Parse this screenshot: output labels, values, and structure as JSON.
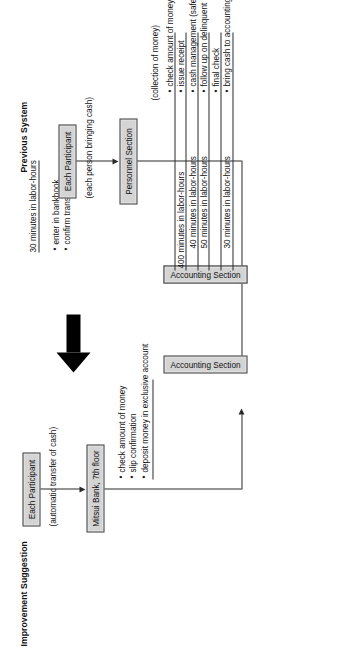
{
  "diagram": {
    "type": "business-process-flow",
    "orientation": "rotated-90-ccw",
    "sections": [
      {
        "id": "improvement",
        "title": "Improvement Suggestion",
        "nodes": [
          {
            "id": "participant",
            "label": "Each Participant"
          },
          {
            "id": "bank",
            "label": "Mitsui Bank, 7th floor"
          },
          {
            "id": "accounting",
            "label": "Accounting Section"
          },
          {
            "id": "personnel",
            "label": "Personnel Section"
          }
        ],
        "flow_caption": "(automatic transfer of cash)",
        "accounting_tasks": [
          "check amount of money",
          "slip confirmation",
          "deposit money in exclusive account"
        ],
        "personnel_metric": "30 minutes in labor-hours",
        "personnel_tasks": [
          "enter in bankbook",
          "confirm transfer"
        ]
      },
      {
        "id": "previous",
        "title": "Previous System",
        "nodes": [
          {
            "id": "participant",
            "label": "Each Participant"
          },
          {
            "id": "personnel",
            "label": "Personnel Section"
          },
          {
            "id": "accounting",
            "label": "Accounting Section"
          }
        ],
        "flow_caption": "(each person bringing cash)",
        "group_caption": "(collection of money)",
        "tasks": [
          {
            "label": "check amount of money",
            "metric": ""
          },
          {
            "label": "issue receipt",
            "metric": "400 minutes in labor-hours"
          },
          {
            "label": "cash management (safe-deposit box)",
            "metric": "40 minutes in labor-hours"
          },
          {
            "label": "follow up on delinquent payers",
            "metric": "50 minutes in labor-hours"
          },
          {
            "label": "final check",
            "metric": ""
          },
          {
            "label": "bring cash to accounting",
            "metric": "30 minutes in labor-hours"
          }
        ]
      }
    ],
    "transition_arrow": "solid-black-up-arrow"
  },
  "colors": {
    "box_fill": "#d4d4d4",
    "box_border": "#4a4a4a",
    "line": "#2b2b2b",
    "text": "#111111",
    "arrow": "#000000",
    "background": "#ffffff"
  }
}
